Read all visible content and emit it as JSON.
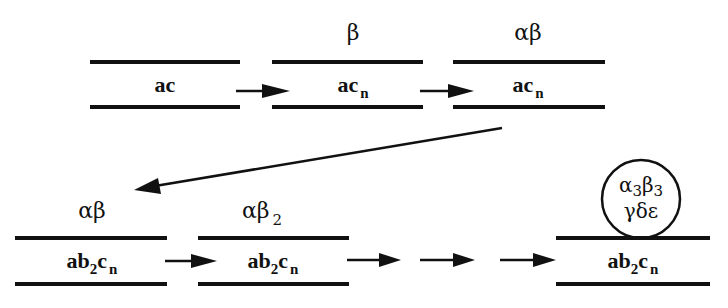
{
  "diagram": {
    "colors": {
      "ink": "#111111",
      "background": "#ffffff"
    },
    "top_row": [
      {
        "id": "t1",
        "strand_base": "ac",
        "strand_sub": "",
        "strand_sub2": "",
        "complex_main": "",
        "complex_sub": ""
      },
      {
        "id": "t2",
        "strand_base": "ac",
        "strand_sub": "n",
        "complex_main": "β",
        "complex_sub": ""
      },
      {
        "id": "t3",
        "strand_base": "ac",
        "strand_sub": "n",
        "complex_main": "αβ",
        "complex_sub": ""
      }
    ],
    "bottom_row": [
      {
        "id": "b1",
        "strand_a": "ab",
        "strand_mid_sub": "2",
        "strand_c": "c",
        "strand_sub": "n",
        "complex_main": "αβ",
        "complex_sub": ""
      },
      {
        "id": "b2",
        "strand_a": "ab",
        "strand_mid_sub": "2",
        "strand_c": "c",
        "strand_sub": "n",
        "complex_main": "αβ",
        "complex_sub": "2"
      },
      {
        "id": "b3",
        "strand_a": "ab",
        "strand_mid_sub": "2",
        "strand_c": "c",
        "strand_sub": "n",
        "holoenzyme_line1": [
          "α",
          "3",
          "β",
          "3"
        ],
        "holoenzyme_line2": "γδε"
      }
    ],
    "arrows": [
      "t1→t2",
      "t2→t3",
      "t3→b1",
      "b1→b2",
      "b2→…",
      "…→…",
      "…→b3"
    ]
  }
}
